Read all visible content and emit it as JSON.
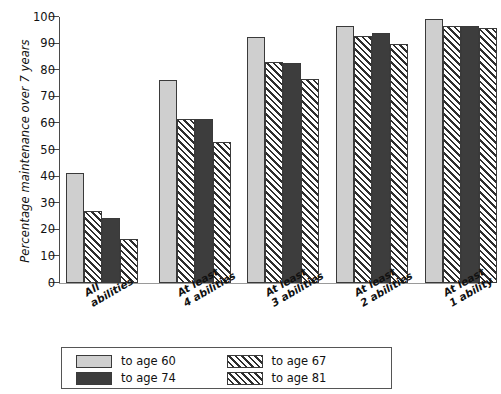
{
  "chart_data": {
    "type": "bar",
    "title": "",
    "xlabel": "",
    "ylabel": "Percentage maintenance over 7 years",
    "ylim": [
      0,
      100
    ],
    "yticks": [
      0,
      10,
      20,
      30,
      40,
      50,
      60,
      70,
      80,
      90,
      100
    ],
    "grid": false,
    "legend_position": "bottom",
    "categories": [
      "All\nabilities",
      "At least\n4 abilities",
      "At least\n3 abilities",
      "At least\n2 abilities",
      "At least\n1 ability"
    ],
    "series": [
      {
        "name": "to age 60",
        "pattern": "solid-light",
        "color": "#cfcfcf",
        "values": [
          41.5,
          76.5,
          92.5,
          96.7,
          99.2
        ]
      },
      {
        "name": "to age 67",
        "pattern": "diagonal-hatch",
        "color": "#ffffff",
        "values": [
          27.0,
          61.5,
          83.0,
          92.7,
          96.7
        ]
      },
      {
        "name": "to age 74",
        "pattern": "solid-dark",
        "color": "#3d3d3d",
        "values": [
          24.3,
          61.7,
          82.7,
          94.0,
          96.7
        ]
      },
      {
        "name": "to age 81",
        "pattern": "cross-hatch",
        "color": "#ffffff",
        "values": [
          16.5,
          53.0,
          76.7,
          90.0,
          96.0
        ]
      }
    ]
  },
  "legend": {
    "items": [
      {
        "label": "to age 60"
      },
      {
        "label": "to age 67"
      },
      {
        "label": "to age 74"
      },
      {
        "label": "to age 81"
      }
    ]
  },
  "colors": {
    "series_light": "#cfcfcf",
    "series_dark": "#3d3d3d",
    "hatch_line": "#2e2e2e",
    "axis": "#4a4a4a",
    "text": "#111111"
  }
}
